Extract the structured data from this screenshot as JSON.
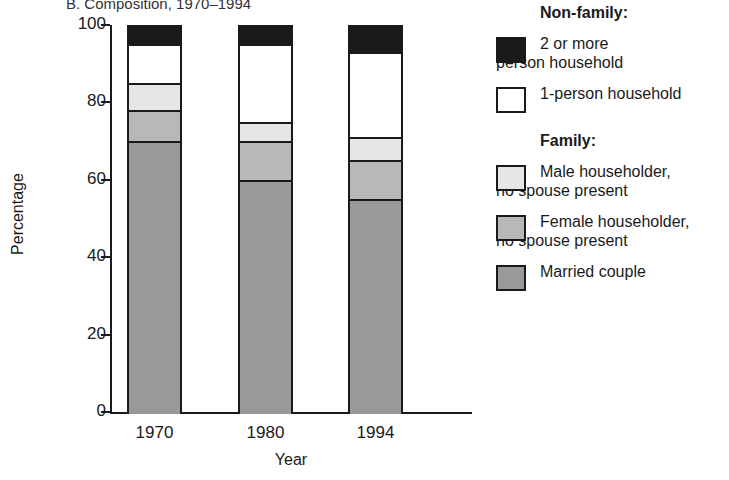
{
  "chart_data": {
    "type": "bar",
    "subtype": "stacked-bar-100-percent",
    "title": "B. Composition, 1970–1994",
    "xlabel": "Year",
    "ylabel": "Percentage",
    "ylim": [
      0,
      100
    ],
    "yticks": [
      0,
      20,
      40,
      60,
      80,
      100
    ],
    "ytick_labels": [
      "0",
      "20",
      "40",
      "60",
      "80",
      "100"
    ],
    "categories": [
      "1970",
      "1980",
      "1994"
    ],
    "grid": false,
    "legend_position": "right",
    "series": [
      {
        "name": "Married couple",
        "values": [
          70,
          60,
          55
        ],
        "color": "#999999"
      },
      {
        "name": "Female householder, no spouse present",
        "values": [
          8,
          10,
          10
        ],
        "color": "#b8b8b8"
      },
      {
        "name": "Male householder, no spouse present",
        "values": [
          7,
          5,
          6
        ],
        "color": "#e6e6e6"
      },
      {
        "name": "1-person household",
        "values": [
          10,
          20,
          22
        ],
        "color": "#ffffff"
      },
      {
        "name": "2 or more person household",
        "values": [
          5,
          5,
          7
        ],
        "color": "#1a1a1a"
      }
    ],
    "cumulative_tops": {
      "1970": [
        70,
        78,
        85,
        95,
        100
      ],
      "1980": [
        60,
        70,
        75,
        95,
        100
      ],
      "1994": [
        55,
        65,
        71,
        93,
        100
      ]
    }
  },
  "legend": {
    "groups": [
      {
        "heading": "Non-family:",
        "entries": [
          {
            "label": "2 or more\nperson household",
            "color": "#1a1a1a"
          },
          {
            "label": "1-person household",
            "color": "#ffffff"
          }
        ]
      },
      {
        "heading": "Family:",
        "entries": [
          {
            "label": "Male householder,\nno spouse present",
            "color": "#e6e6e6"
          },
          {
            "label": "Female householder,\nno spouse present",
            "color": "#b8b8b8"
          },
          {
            "label": "Married couple",
            "color": "#999999"
          }
        ]
      }
    ]
  },
  "colors": {
    "axis": "#1a1a1a",
    "text": "#1a1a1a",
    "background": "#ffffff"
  }
}
